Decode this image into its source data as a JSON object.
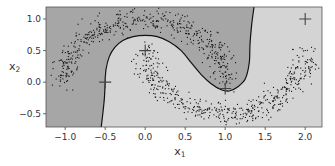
{
  "chart_data": {
    "type": "scatter",
    "title": "",
    "xlabel": "x",
    "xlabel_subscript": "1",
    "ylabel": "x",
    "ylabel_subscript": "2",
    "xlim": [
      -1.24,
      2.21
    ],
    "ylim": [
      -0.71,
      1.19
    ],
    "xticks": [
      -1.0,
      -0.5,
      0.0,
      0.5,
      1.0,
      1.5,
      2.0
    ],
    "xtick_labels": [
      "−1.0",
      "−0.5",
      "0.0",
      "0.5",
      "1.0",
      "1.5",
      "2.0"
    ],
    "yticks": [
      -0.5,
      0.0,
      0.5,
      1.0
    ],
    "ytick_labels": [
      "−0.5",
      "0.0",
      "0.5",
      "1.0"
    ],
    "grid": false,
    "legend": null,
    "background_regions": {
      "class_a_color": "#a6a6a6",
      "class_b_color": "#d4d4d4",
      "boundary_color": "#111111"
    },
    "decision_boundary": [
      [
        -0.55,
        -0.71
      ],
      [
        -0.53,
        -0.5
      ],
      [
        -0.51,
        -0.25
      ],
      [
        -0.5,
        0.0
      ],
      [
        -0.49,
        0.2
      ],
      [
        -0.45,
        0.4
      ],
      [
        -0.38,
        0.55
      ],
      [
        -0.28,
        0.66
      ],
      [
        -0.15,
        0.72
      ],
      [
        0.0,
        0.74
      ],
      [
        0.15,
        0.72
      ],
      [
        0.3,
        0.64
      ],
      [
        0.45,
        0.5
      ],
      [
        0.58,
        0.3
      ],
      [
        0.7,
        0.12
      ],
      [
        0.82,
        -0.02
      ],
      [
        0.95,
        -0.12
      ],
      [
        1.05,
        -0.14
      ],
      [
        1.15,
        -0.08
      ],
      [
        1.25,
        0.05
      ],
      [
        1.3,
        0.3
      ],
      [
        1.31,
        0.6
      ],
      [
        1.33,
        0.9
      ],
      [
        1.36,
        1.19
      ]
    ],
    "landmarks": [
      {
        "x": -0.5,
        "y": 0.0
      },
      {
        "x": 0.0,
        "y": 0.5
      },
      {
        "x": 1.0,
        "y": -0.1
      },
      {
        "x": 2.0,
        "y": 1.0
      }
    ],
    "series": [
      {
        "name": "upper moon",
        "shape": "semicircle",
        "center": [
          0.0,
          0.0
        ],
        "radius": 1.0,
        "angle_range_deg": [
          0,
          180
        ],
        "noise": 0.05,
        "n_points": 500
      },
      {
        "name": "lower moon",
        "shape": "semicircle",
        "center": [
          1.0,
          0.5
        ],
        "radius": 1.0,
        "angle_range_deg": [
          180,
          360
        ],
        "noise": 0.05,
        "n_points": 500
      }
    ],
    "point_color": "#111111",
    "marker_color": "#444444"
  }
}
